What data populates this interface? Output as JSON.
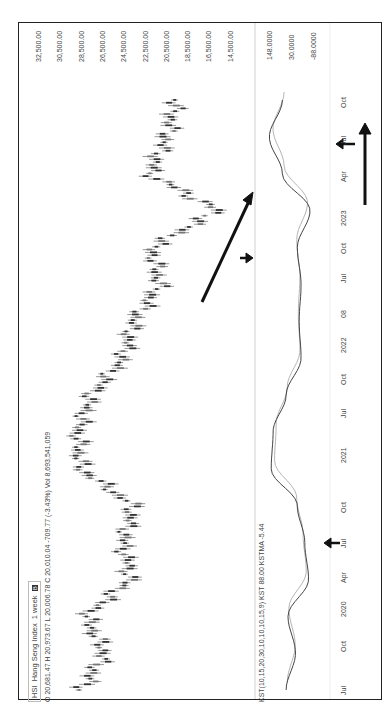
{
  "header": {
    "symbol": "HSI",
    "name": "Hang Seng Index",
    "interval": "1 week",
    "badge": "B",
    "ohlc_line": "O 20,681.47  H 20,973.67  L 20,006.78  C 20,010.04  -709.77 (-3.43%)   Vol 8,693,541,059"
  },
  "indicator": {
    "legend": "KST(10,15,20,30,10,10,10,15,9) KST 88.00  KSTMA -5.44"
  },
  "price_axis": [
    "32,500.00",
    "30,500.00",
    "28,500.00",
    "26,500.00",
    "24,500.00",
    "22,500.00",
    "20,500.00",
    "18,500.00",
    "16,500.00",
    "14,500.00"
  ],
  "kst_axis": [
    "148.0000",
    "30.0000",
    "-88.0000"
  ],
  "time_axis": [
    "Jul",
    "Oct",
    "2020",
    "Apr",
    "Jul",
    "Oct",
    "2021",
    "Jul",
    "Oct",
    "2022",
    "08",
    "Jul",
    "Oct",
    "2023",
    "Apr",
    "Jul",
    "Oct"
  ],
  "colors": {
    "candle": "#333333",
    "kst": "#444444",
    "kstma": "#b5b5b5",
    "arrow": "#111111",
    "border": "#222222"
  },
  "chart_data": {
    "type": "line",
    "subtitle": "O 20,681.47 H 20,973.67 L 20,006.78 C 20,010.04 -709.77 (-3.43%) Vol 8,693,541,059",
    "xlabel": "",
    "ylabel": "",
    "x": [
      "Jul 2019",
      "Oct 2019",
      "Jan 2020",
      "Apr 2020",
      "Jul 2020",
      "Oct 2020",
      "Jan 2021",
      "Apr 2021",
      "Jul 2021",
      "Oct 2021",
      "Jan 2022",
      "Apr 2022",
      "Jul 2022",
      "Oct 2022",
      "Jan 2023",
      "Apr 2023",
      "Jul 2023"
    ],
    "series": [
      {
        "name": "HSI (close, approx)",
        "values": [
          28400,
          26200,
          28000,
          23800,
          24500,
          23500,
          28500,
          28800,
          27500,
          24500,
          23500,
          21000,
          21800,
          15500,
          22000,
          20300,
          19500
        ]
      },
      {
        "name": "KST (approx)",
        "values": [
          40,
          -10,
          30,
          -80,
          -60,
          -20,
          120,
          110,
          40,
          -40,
          -30,
          -40,
          -20,
          -88,
          60,
          130,
          60
        ]
      }
    ],
    "price_ylim": [
      14500,
      32500
    ],
    "kst_ylim": [
      -88,
      148
    ],
    "annotations": [
      "arrows marking KST lows (Jun 2020, Oct 2022) and high (Feb 2021)",
      "diagonal arrow upward from 2022 low",
      "vertical up-arrow under 2022-2023 time axis"
    ],
    "grid": false,
    "legend_position": "top-left"
  }
}
